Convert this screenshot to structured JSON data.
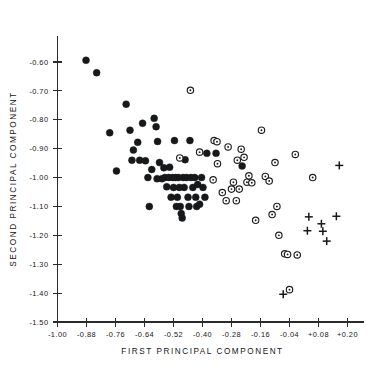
{
  "chart_data": {
    "type": "scatter",
    "title": "",
    "xlabel": "FIRST PRINCIPAL COMPONENT",
    "ylabel": "SECOND PRINCIPAL COMPONENT",
    "xlim": [
      -1.0,
      0.23
    ],
    "ylim": [
      -1.5,
      -0.555
    ],
    "grid": false,
    "legend": "none",
    "xticks": [
      -1.0,
      -0.88,
      -0.76,
      -0.64,
      -0.52,
      -0.4,
      -0.28,
      -0.16,
      -0.04,
      0.08,
      0.2
    ],
    "xticklabels": [
      "-1.00",
      "-0.88",
      "-0.76",
      "-0.64",
      "-0.52",
      "-0.40",
      "-0.28",
      "-0.16",
      "-0.04",
      "+0.08",
      "+0.20"
    ],
    "yticks": [
      -0.6,
      -0.7,
      -0.8,
      -0.9,
      -1.0,
      -1.1,
      -1.2,
      -1.3,
      -1.4,
      -1.5
    ],
    "yticklabels": [
      "-0.60",
      "-0.70",
      "-0.80",
      "-0.90",
      "-1.00",
      "-1.10",
      "-1.20",
      "-1.30",
      "-1.40",
      "-1.50"
    ],
    "series": [
      {
        "name": "filled-circle-group",
        "marker": "filled-circle",
        "color": "#17181a",
        "points": [
          [
            -0.882,
            -0.594
          ],
          [
            -0.838,
            -0.637
          ],
          [
            -0.784,
            -0.845
          ],
          [
            -0.716,
            -0.746
          ],
          [
            -0.756,
            -0.977
          ],
          [
            -0.7,
            -0.836
          ],
          [
            -0.686,
            -0.905
          ],
          [
            -0.668,
            -0.878
          ],
          [
            -0.66,
            -0.94
          ],
          [
            -0.692,
            -0.94
          ],
          [
            -0.636,
            -0.942
          ],
          [
            -0.648,
            -0.812
          ],
          [
            -0.626,
            -1.0
          ],
          [
            -0.61,
            -0.972
          ],
          [
            -0.6,
            -0.795
          ],
          [
            -0.592,
            -0.824
          ],
          [
            -0.586,
            -0.875
          ],
          [
            -0.578,
            -0.948
          ],
          [
            -0.568,
            -1.004
          ],
          [
            -0.56,
            -0.966
          ],
          [
            -0.556,
            -1.0
          ],
          [
            -0.548,
            -1.032
          ],
          [
            -0.54,
            -1.0
          ],
          [
            -0.536,
            -0.964
          ],
          [
            -0.53,
            -1.068
          ],
          [
            -0.524,
            -1.0
          ],
          [
            -0.52,
            -1.034
          ],
          [
            -0.516,
            -0.872
          ],
          [
            -0.512,
            -1.0
          ],
          [
            -0.508,
            -1.1
          ],
          [
            -0.504,
            -1.068
          ],
          [
            -0.5,
            -1.0
          ],
          [
            -0.496,
            -1.034
          ],
          [
            -0.492,
            -1.1
          ],
          [
            -0.488,
            -1.124
          ],
          [
            -0.484,
            -1.14
          ],
          [
            -0.48,
            -1.0
          ],
          [
            -0.476,
            -1.034
          ],
          [
            -0.472,
            -0.938
          ],
          [
            -0.466,
            -1.0
          ],
          [
            -0.46,
            -1.068
          ],
          [
            -0.456,
            -1.1
          ],
          [
            -0.452,
            -0.872
          ],
          [
            -0.448,
            -1.0
          ],
          [
            -0.44,
            -1.034
          ],
          [
            -0.432,
            -1.0
          ],
          [
            -0.428,
            -1.068
          ],
          [
            -0.424,
            -1.1
          ],
          [
            -0.42,
            -1.024
          ],
          [
            -0.412,
            -1.092
          ],
          [
            -0.404,
            -1.0
          ],
          [
            -0.398,
            -1.034
          ],
          [
            -0.39,
            -1.068
          ],
          [
            -0.382,
            -0.916
          ],
          [
            -0.62,
            -1.1
          ],
          [
            -0.588,
            -1.004
          ],
          [
            -0.344,
            -0.916
          ],
          [
            -0.236,
            -0.96
          ]
        ]
      },
      {
        "name": "open-circle-group",
        "marker": "open-circle",
        "color": "#1d1e20",
        "points": [
          [
            -0.45,
            -0.698
          ],
          [
            -0.494,
            -0.932
          ],
          [
            -0.412,
            -0.912
          ],
          [
            -0.352,
            -0.872
          ],
          [
            -0.338,
            -0.952
          ],
          [
            -0.356,
            -1.008
          ],
          [
            -0.318,
            -1.052
          ],
          [
            -0.302,
            -1.08
          ],
          [
            -0.294,
            -0.894
          ],
          [
            -0.28,
            -1.04
          ],
          [
            -0.272,
            -1.016
          ],
          [
            -0.26,
            -1.08
          ],
          [
            -0.256,
            -0.94
          ],
          [
            -0.24,
            -0.902
          ],
          [
            -0.228,
            -0.93
          ],
          [
            -0.216,
            -1.016
          ],
          [
            -0.208,
            -0.994
          ],
          [
            -0.196,
            -1.018
          ],
          [
            -0.18,
            -1.148
          ],
          [
            -0.156,
            -0.836
          ],
          [
            -0.14,
            -0.996
          ],
          [
            -0.124,
            -1.012
          ],
          [
            -0.112,
            -1.128
          ],
          [
            -0.1,
            -0.948
          ],
          [
            -0.092,
            -1.1
          ],
          [
            -0.084,
            -1.2
          ],
          [
            -0.06,
            -1.264
          ],
          [
            -0.048,
            -1.266
          ],
          [
            -0.04,
            -1.388
          ],
          [
            -0.016,
            -0.92
          ],
          [
            -0.008,
            -1.268
          ],
          [
            0.056,
            -1.0
          ],
          [
            -0.34,
            -0.876
          ],
          [
            -0.248,
            -1.04
          ]
        ]
      },
      {
        "name": "plus-group",
        "marker": "plus",
        "color": "#17181a",
        "points": [
          [
            0.04,
            -1.136
          ],
          [
            0.034,
            -1.184
          ],
          [
            0.092,
            -1.16
          ],
          [
            0.098,
            -1.186
          ],
          [
            0.114,
            -1.22
          ],
          [
            0.154,
            -1.134
          ],
          [
            0.166,
            -0.958
          ],
          [
            -0.066,
            -1.404
          ]
        ]
      }
    ]
  },
  "axis": {
    "x_title": "FIRST PRINCIPAL COMPONENT",
    "y_title": "SECOND PRINCIPAL COMPONENT"
  }
}
